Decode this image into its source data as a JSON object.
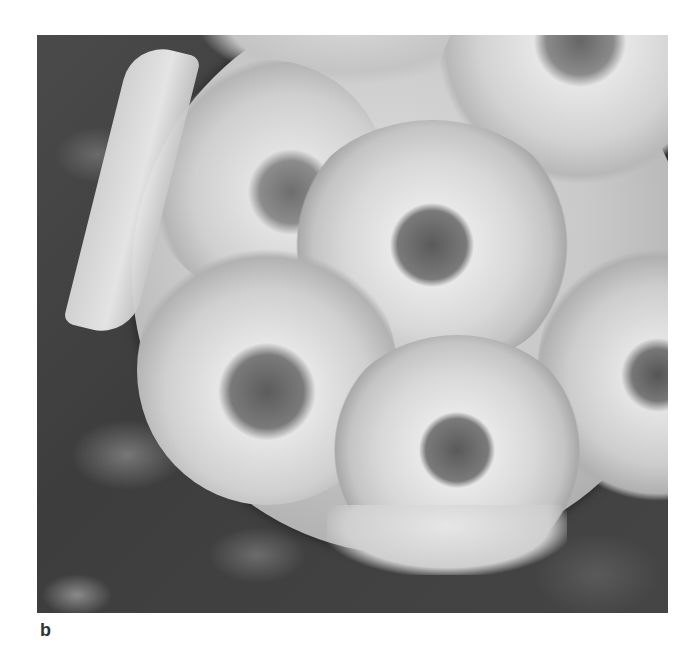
{
  "figure": {
    "panel_label": "b",
    "image_description": "Scanning electron micrograph of a coccosphere covered with overlapping ring-shaped coccolith plates, resting on a rough dark substrate",
    "colors": {
      "background": "#ffffff",
      "substrate_dark": "#3d3d3d",
      "plate_light": "#e0e0e0",
      "label": "#333333"
    }
  }
}
